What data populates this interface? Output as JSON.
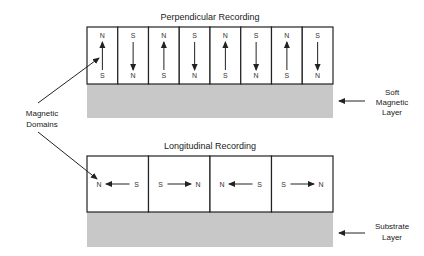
{
  "diagram": {
    "perpendicular": {
      "title": "Perpendicular Recording",
      "domains": [
        {
          "top": "N",
          "bottom": "S",
          "arrow": "up"
        },
        {
          "top": "S",
          "bottom": "N",
          "arrow": "down"
        },
        {
          "top": "N",
          "bottom": "S",
          "arrow": "up"
        },
        {
          "top": "S",
          "bottom": "N",
          "arrow": "down"
        },
        {
          "top": "N",
          "bottom": "S",
          "arrow": "up"
        },
        {
          "top": "S",
          "bottom": "N",
          "arrow": "down"
        },
        {
          "top": "N",
          "bottom": "S",
          "arrow": "up"
        },
        {
          "top": "S",
          "bottom": "N",
          "arrow": "down"
        }
      ],
      "layer_label": [
        "Soft",
        "Magnetic",
        "Layer"
      ]
    },
    "longitudinal": {
      "title": "Longitudinal Recording",
      "domains": [
        {
          "left": "N",
          "right": "S",
          "arrow": "left"
        },
        {
          "left": "S",
          "right": "N",
          "arrow": "right"
        },
        {
          "left": "N",
          "right": "S",
          "arrow": "left"
        },
        {
          "left": "S",
          "right": "N",
          "arrow": "right"
        }
      ],
      "layer_label": [
        "Substrate",
        "Layer"
      ]
    },
    "domains_label": [
      "Magnetic",
      "Domains"
    ],
    "colors": {
      "layer_fill": "#c8c8c8",
      "box_fill": "#ffffff",
      "stroke": "#222222"
    }
  }
}
